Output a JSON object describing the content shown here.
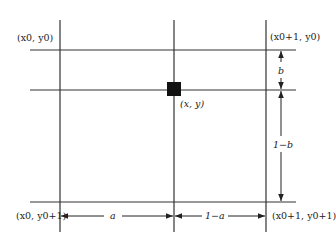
{
  "diagram": {
    "type": "bilinear-interpolation-grid",
    "corners": {
      "top_left": "(x0, y0)",
      "top_right": "(x0+1, y0)",
      "bottom_left": "(x0, y0+1)",
      "bottom_right": "(x0+1, y0+1)"
    },
    "point": "(x, y)",
    "dimensions": {
      "horizontal_left": "a",
      "horizontal_right": "1−a",
      "vertical_top": "b",
      "vertical_bottom": "1−b"
    },
    "colors": {
      "line": "#333333",
      "point": "#111111",
      "background": "#ffffff"
    }
  }
}
